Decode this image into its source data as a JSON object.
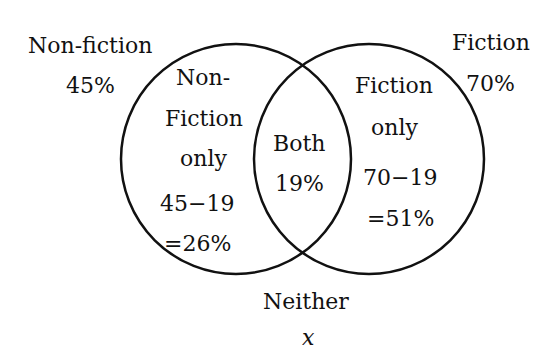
{
  "sets": {
    "non_fiction": {
      "name": "Non-fiction",
      "total": "45%"
    },
    "fiction": {
      "name": "Fiction",
      "total": "70%"
    }
  },
  "regions": {
    "non_fiction_only": {
      "line1": "Non-",
      "line2": "Fiction",
      "line3": "only",
      "calc": "45−19",
      "result": "=26%"
    },
    "both": {
      "line1": "Both",
      "value": "19%"
    },
    "fiction_only": {
      "line1": "Fiction",
      "line2": "only",
      "calc": "70−19",
      "result": "=51%"
    },
    "neither": {
      "label": "Neither",
      "value": "x"
    }
  },
  "colors": {
    "stroke": "#111111",
    "background": "#ffffff"
  }
}
